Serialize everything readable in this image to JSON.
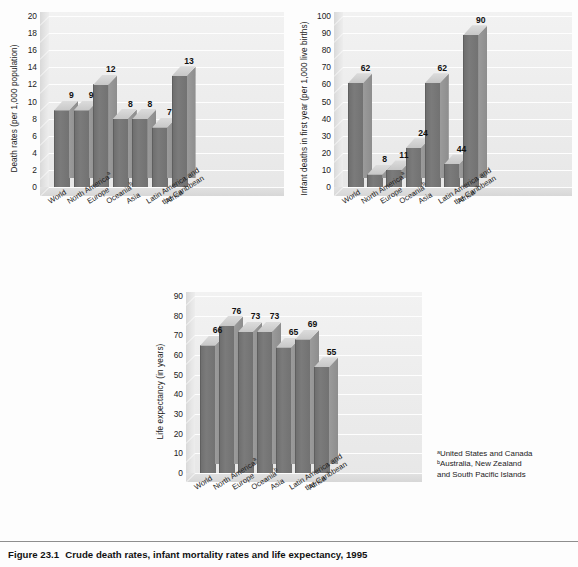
{
  "figure": {
    "caption_number": "Figure 23.1",
    "caption_text": "Crude death rates, infant mortality rates and life expectancy, 1995"
  },
  "footnotes": {
    "a": "ᵃUnited States and Canada",
    "b_line1": "ᵇAustralia, New Zealand",
    "b_line2": "and South Pacific Islands"
  },
  "categories": [
    {
      "line1": "World",
      "line2": "",
      "sup": ""
    },
    {
      "line1": "North America",
      "line2": "",
      "sup": "a"
    },
    {
      "line1": "Europe",
      "line2": "",
      "sup": ""
    },
    {
      "line1": "Oceania",
      "line2": "",
      "sup": "b"
    },
    {
      "line1": "Asia",
      "line2": "",
      "sup": ""
    },
    {
      "line1": "Latin America and",
      "line2": "the Caribbean",
      "sup": ""
    },
    {
      "line1": "Africa",
      "line2": "",
      "sup": ""
    }
  ],
  "chart_data": [
    {
      "type": "bar",
      "id": "death-rates",
      "title": "",
      "xlabel": "",
      "ylabel": "Death rates (per 1,000 population)",
      "ylim": [
        0,
        20
      ],
      "ytick_step": 2,
      "yticks": [
        0,
        2,
        4,
        6,
        8,
        10,
        12,
        14,
        16,
        18,
        20
      ],
      "grid": true,
      "legend": "none",
      "categories": [
        "World",
        "North Americaᵃ",
        "Europe",
        "Oceaniaᵇ",
        "Asia",
        "Latin America and the Caribbean",
        "Africa"
      ],
      "values": [
        9,
        9,
        12,
        8,
        8,
        7,
        13
      ],
      "labels": [
        "9",
        "9",
        "12",
        "8",
        "8",
        "7",
        "13"
      ]
    },
    {
      "type": "bar",
      "id": "infant-deaths",
      "title": "",
      "xlabel": "",
      "ylabel": "Infant deaths in first year (per 1,000 live births)",
      "ylim": [
        0,
        100
      ],
      "ytick_step": 10,
      "yticks": [
        0,
        10,
        20,
        30,
        40,
        50,
        60,
        70,
        80,
        90,
        100
      ],
      "grid": true,
      "legend": "none",
      "categories": [
        "World",
        "North Americaᵃ",
        "Europe",
        "Oceaniaᵇ",
        "Asia",
        "Latin America and the Caribbean",
        "Africa"
      ],
      "values": [
        62,
        8,
        11,
        24,
        62,
        44,
        90
      ],
      "plotted_heights": [
        61,
        7.5,
        10,
        23,
        61,
        13.5,
        89
      ],
      "labels": [
        "62",
        "8",
        "11",
        "24",
        "62",
        "44",
        "90"
      ]
    },
    {
      "type": "bar",
      "id": "life-expectancy",
      "title": "",
      "xlabel": "",
      "ylabel": "Life expectancy (in years)",
      "ylim": [
        0,
        90
      ],
      "ytick_step": 10,
      "yticks": [
        0,
        10,
        20,
        30,
        40,
        50,
        60,
        70,
        80,
        90
      ],
      "grid": true,
      "legend": "none",
      "categories": [
        "World",
        "North Americaᵃ",
        "Europe",
        "Oceaniaᵇ",
        "Asia",
        "Latin America and the Caribbean",
        "Africa"
      ],
      "values": [
        66,
        76,
        73,
        73,
        65,
        69,
        55
      ],
      "plotted_heights": [
        65,
        75,
        72,
        72,
        64,
        68,
        54
      ],
      "labels": [
        "66",
        "76",
        "73",
        "73",
        "65",
        "69",
        "55"
      ]
    }
  ],
  "colors": {
    "bar_front": "#757575",
    "bar_side": "#939393",
    "bar_top": "#d2d2d2",
    "plot_bg": "#eeeeee",
    "grid": "#ffffff",
    "text": "#1a1a1a"
  }
}
